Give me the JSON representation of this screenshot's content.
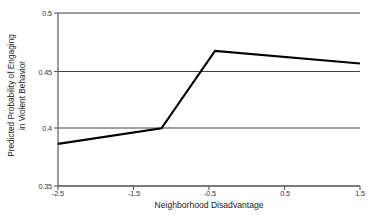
{
  "chart_data": {
    "type": "line",
    "title": "",
    "subtitle": "",
    "xlabel": "Neighborhood Disadvantage",
    "ylabel": "Predicted Probability of Engaging in Violent Behavior",
    "ylabel_line1": "Predicted Probability of Engaging",
    "ylabel_line2": "in Violent Behavior",
    "xlim": [
      -2.5,
      1.5
    ],
    "ylim": [
      0.35,
      0.5
    ],
    "xticks": [
      -2.5,
      -1.5,
      -0.5,
      0.5,
      1.5
    ],
    "xtick_labels": [
      "-2.5",
      "-1.5",
      "-0.5",
      "0.5",
      "1.5"
    ],
    "yticks": [
      0.35,
      0.4,
      0.45,
      0.5
    ],
    "ytick_labels": [
      "0.35",
      "0.4",
      "0.45",
      "0.5"
    ],
    "grid": "horizontal",
    "legend": "none",
    "series": [
      {
        "name": "Predicted probability",
        "color": "#000000",
        "line_width": 2,
        "x": [
          -2.5,
          -1.13,
          -0.42,
          1.5
        ],
        "y": [
          0.3865,
          0.4,
          0.4672,
          0.4562
        ]
      }
    ]
  },
  "axes": {
    "y_axis_color": "#595959",
    "x_axis_color": "#595959",
    "gridline_color": "#404040",
    "background": "#ffffff"
  }
}
